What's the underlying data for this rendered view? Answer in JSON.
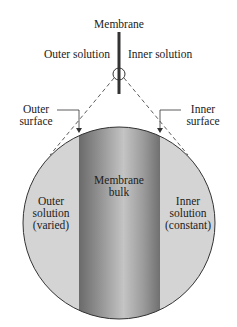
{
  "labels": {
    "membrane": "Membrane",
    "outer_solution_top": "Outer solution",
    "inner_solution_top": "Inner solution",
    "outer_surface": [
      "Outer",
      "surface"
    ],
    "inner_surface": [
      "Inner",
      "surface"
    ],
    "membrane_bulk": [
      "Membrane",
      "bulk"
    ],
    "outer_solution_region": [
      "Outer",
      "solution",
      "(varied)"
    ],
    "inner_solution_region": [
      "Inner",
      "solution",
      "(constant)"
    ]
  },
  "colors": {
    "solution_fill": "#d4d4d4",
    "membrane_dark": "#6e6e6e",
    "membrane_light": "#bdbdbd",
    "line": "#333333"
  }
}
